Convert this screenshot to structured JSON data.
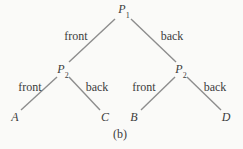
{
  "figure": {
    "caption": "(b)",
    "colors": {
      "background": "#fafaf8",
      "line": "#8d8d8d",
      "text": "#3c3c3c"
    },
    "tree": {
      "root": {
        "base": "P",
        "sub": "1"
      },
      "root_edges": {
        "left": "front",
        "right": "back"
      },
      "left": {
        "node": {
          "base": "P",
          "sub": "2"
        },
        "edges": {
          "left": "front",
          "right": "back"
        },
        "leaves": {
          "left": "A",
          "right": "C"
        }
      },
      "right": {
        "node": {
          "base": "P",
          "sub": "2"
        },
        "edges": {
          "left": "front",
          "right": "back"
        },
        "leaves": {
          "left": "B",
          "right": "D"
        }
      }
    }
  }
}
